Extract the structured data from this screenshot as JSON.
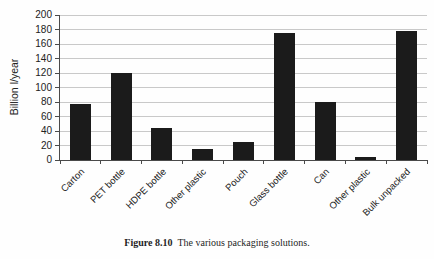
{
  "chart_data": {
    "type": "bar",
    "categories": [
      "Carton",
      "PET bottle",
      "HDPE bottle",
      "Other plastic",
      "Pouch",
      "Glass bottle",
      "Can",
      "Other plastic",
      "Bulk unpacked"
    ],
    "values": [
      77,
      120,
      44,
      15,
      25,
      175,
      80,
      4,
      178
    ],
    "title": "",
    "xlabel": "",
    "ylabel": "Billion l/year",
    "ylim": [
      0,
      200
    ],
    "ytick_step": 20,
    "grid": true,
    "legend": "none",
    "bar_color": "#1b1b1b",
    "grid_color": "#c9c9c9",
    "axis_color": "#4a4a4a"
  },
  "caption": {
    "label": "Figure 8.10",
    "text": "The various packaging solutions."
  }
}
